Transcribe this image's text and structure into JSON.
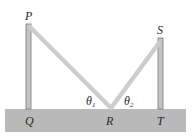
{
  "diagram": {
    "points": {
      "P": {
        "label": "P"
      },
      "Q": {
        "label": "Q"
      },
      "R": {
        "label": "R"
      },
      "S": {
        "label": "S"
      },
      "T": {
        "label": "T"
      }
    },
    "angles": [
      {
        "symbol": "θ",
        "subscript": "1"
      },
      {
        "symbol": "θ",
        "subscript": "2"
      }
    ],
    "colors": {
      "ground": "#b9b9b9",
      "post": "#bdbdbd",
      "post_edge": "#7a7a7a",
      "wire": "#cfcfcf",
      "text": "#2a2a2a"
    }
  }
}
